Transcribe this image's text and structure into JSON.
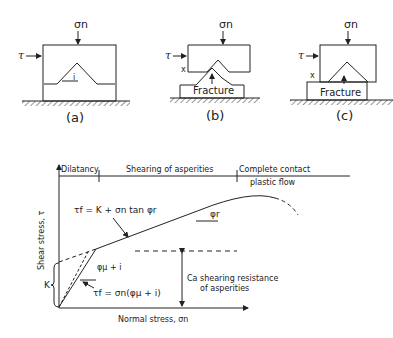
{
  "panels": [
    {
      "id": "a",
      "caption": "(a)",
      "normal_label": "σn",
      "shear_label": "τ",
      "angle_label": "i"
    },
    {
      "id": "b",
      "caption": "(b)",
      "normal_label": "σn",
      "shear_label": "τ",
      "fracture_label": "Fracture",
      "x_label": "x"
    },
    {
      "id": "c",
      "caption": "(c)",
      "normal_label": "σn",
      "shear_label": "τ",
      "fracture_label": "Fracture",
      "x_label": "x"
    }
  ],
  "graph": {
    "y_axis_label": "Shear stress, τ",
    "x_axis_label": "Normal stress, σn",
    "regions": {
      "dilatancy": "Dilatancy",
      "shearing": "Shearing of asperities",
      "complete_1": "Complete contact",
      "complete_2": "plastic flow"
    },
    "eq_upper": "τf = K + σn tan φr",
    "eq_lower": "τf = σn(φμ + i)",
    "angle_r": "φr",
    "angle_mu": "φμ + i",
    "k_label": "K",
    "ca_label": "Ca shearing resistance",
    "ca_label_2": "of asperities"
  }
}
